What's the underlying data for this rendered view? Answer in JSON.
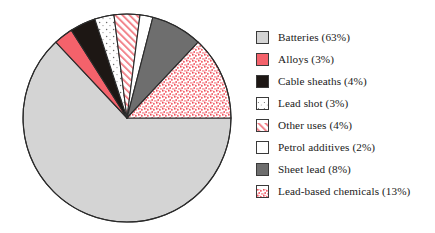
{
  "chart_data": {
    "type": "pie",
    "title": "",
    "subtitle": "",
    "xlabel": "",
    "ylabel": "",
    "unit": "%",
    "legend_position": "right",
    "grid": false,
    "start_angle_deg": 0,
    "direction": "clockwise",
    "categories": [
      "Batteries",
      "Alloys",
      "Cable sheaths",
      "Lead shot",
      "Other uses",
      "Petrol additives",
      "Sheet lead",
      "Lead-based chemicals"
    ],
    "values": [
      63,
      3,
      4,
      3,
      4,
      2,
      8,
      13
    ],
    "total": 100,
    "slices": [
      {
        "label": "Batteries",
        "value": 63,
        "legend_text": "Batteries (63%)",
        "fill": "#d4d4d4",
        "pattern": "solid",
        "stroke": "#2b2b2b"
      },
      {
        "label": "Alloys",
        "value": 3,
        "legend_text": "Alloys (3%)",
        "fill": "#f4626b",
        "pattern": "solid",
        "stroke": "#2b2b2b"
      },
      {
        "label": "Cable sheaths",
        "value": 4,
        "legend_text": "Cable sheaths (4%)",
        "fill": "#1d1714",
        "pattern": "solid",
        "stroke": "#2b2b2b"
      },
      {
        "label": "Lead shot",
        "value": 3,
        "legend_text": "Lead shot (3%)",
        "fill": "#ffffff",
        "pattern": "sparse-dots",
        "stroke": "#2b2b2b"
      },
      {
        "label": "Other uses",
        "value": 4,
        "legend_text": "Other uses (4%)",
        "fill": "#ffffff",
        "pattern": "diagonal-hatch",
        "stroke": "#2b2b2b"
      },
      {
        "label": "Petrol additives",
        "value": 2,
        "legend_text": "Petrol additives (2%)",
        "fill": "#ffffff",
        "pattern": "solid",
        "stroke": "#2b2b2b"
      },
      {
        "label": "Sheet lead",
        "value": 8,
        "legend_text": "Sheet lead (8%)",
        "fill": "#6e6e6e",
        "pattern": "solid",
        "stroke": "#2b2b2b"
      },
      {
        "label": "Lead-based chemicals",
        "value": 13,
        "legend_text": "Lead-based chemicals (13%)",
        "fill": "#ffffff",
        "pattern": "dense-speckle",
        "stroke": "#2b2b2b"
      }
    ],
    "geometry": {
      "cx": 127,
      "cy": 118,
      "r": 104
    },
    "colors": {
      "light_gray": "#d4d4d4",
      "salmon_red": "#f4626b",
      "near_black": "#1d1714",
      "white": "#ffffff",
      "mid_gray": "#6e6e6e",
      "speckle_red": "#f0505c",
      "outline": "#2b2b2b",
      "text": "#1a1a1a",
      "background": "#ffffff"
    }
  },
  "legend": {
    "items": [
      {
        "label": "Batteries (63%)",
        "icon": "swatch-solid-light-gray"
      },
      {
        "label": "Alloys (3%)",
        "icon": "swatch-solid-red"
      },
      {
        "label": "Cable sheaths (4%)",
        "icon": "swatch-solid-black"
      },
      {
        "label": "Lead shot (3%)",
        "icon": "swatch-sparse-dots"
      },
      {
        "label": "Other uses (4%)",
        "icon": "swatch-diagonal-hatch"
      },
      {
        "label": "Petrol additives (2%)",
        "icon": "swatch-white"
      },
      {
        "label": "Sheet lead (8%)",
        "icon": "swatch-solid-dark-gray"
      },
      {
        "label": "Lead-based chemicals (13%)",
        "icon": "swatch-dense-speckle"
      }
    ]
  }
}
